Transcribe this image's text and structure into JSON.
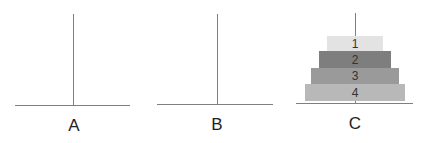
{
  "diagram": {
    "pegs": [
      {
        "id": "A",
        "label": "A",
        "disks": []
      },
      {
        "id": "B",
        "label": "B",
        "disks": []
      },
      {
        "id": "C",
        "label": "C",
        "disks": [
          "1",
          "2",
          "3",
          "4"
        ]
      }
    ],
    "disks": [
      {
        "label": "1",
        "color": "#e3e3e3"
      },
      {
        "label": "2",
        "color": "#7e7e7e"
      },
      {
        "label": "3",
        "color": "#9a9a9a"
      },
      {
        "label": "4",
        "color": "#b8b8b8"
      }
    ],
    "line_color": "#7f7f7f"
  }
}
